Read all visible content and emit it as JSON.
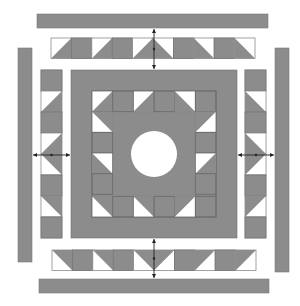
{
  "diagram": {
    "colors": {
      "fabric": "#8c8c8c",
      "background": "#ffffff",
      "seam": "#6a6a6a",
      "arrow": "#222222"
    },
    "outer_bars": [
      {
        "name": "top-border-bar",
        "x": 37,
        "y": 14,
        "w": 231,
        "h": 14
      },
      {
        "name": "bottom-border-bar",
        "x": 39,
        "y": 279,
        "w": 230,
        "h": 14
      },
      {
        "name": "left-border-bar",
        "x": 18,
        "y": 48,
        "w": 14,
        "h": 214
      },
      {
        "name": "right-border-bar",
        "x": 275,
        "y": 48,
        "w": 14,
        "h": 224
      }
    ],
    "strips": {
      "top": {
        "x": 51,
        "y": 38,
        "cell": 20.4,
        "count": 10,
        "orientation": "h",
        "cells": [
          "tri-bl",
          "solid",
          "tri-bl",
          "solid",
          "tri-bl",
          "tri-br",
          "solid",
          "tri-br",
          "solid",
          "tri-br"
        ]
      },
      "bottom": {
        "x": 52,
        "y": 250,
        "cell": 20.4,
        "count": 10,
        "orientation": "h",
        "cells": [
          "tri-tr",
          "solid",
          "tri-tr",
          "solid",
          "tri-tr",
          "tri-tl",
          "solid",
          "tri-tl",
          "solid",
          "tri-tl"
        ]
      },
      "left": {
        "x": 41,
        "y": 70,
        "cell": 21,
        "count": 8,
        "orientation": "v",
        "cells": [
          "solid",
          "tri-br",
          "solid",
          "tri-br",
          "tri-tr",
          "solid",
          "tri-tr",
          "solid"
        ]
      },
      "right": {
        "x": 245,
        "y": 70,
        "cell": 21,
        "count": 8,
        "orientation": "v",
        "cells": [
          "solid",
          "tri-bl",
          "solid",
          "tri-bl",
          "tri-tl",
          "solid",
          "tri-tl",
          "solid"
        ]
      }
    },
    "center_block": {
      "x": 71,
      "y": 70,
      "w": 166,
      "h": 168,
      "inner_inset": 21,
      "circle": {
        "cx": 154,
        "cy": 154,
        "r": 23
      }
    },
    "arrows": [
      {
        "name": "top-join-arrow",
        "x1": 154,
        "y1": 29,
        "x2": 154,
        "y2": 69
      },
      {
        "name": "bottom-join-arrow",
        "x1": 154,
        "y1": 239,
        "x2": 154,
        "y2": 278
      },
      {
        "name": "left-join-arrow",
        "x1": 33,
        "y1": 155,
        "x2": 70,
        "y2": 155
      },
      {
        "name": "right-join-arrow",
        "x1": 238,
        "y1": 155,
        "x2": 274,
        "y2": 155
      }
    ]
  }
}
